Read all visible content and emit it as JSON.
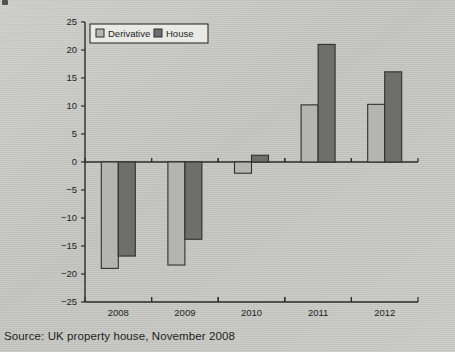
{
  "figure": {
    "source_note": "Source: UK property house, November 2008"
  },
  "legend": {
    "position": "top-left-inside",
    "entries": [
      {
        "label": "Derivative",
        "swatch": "light-gray-square",
        "color": "#b4b4b0"
      },
      {
        "label": "House",
        "swatch": "dark-gray-square",
        "color": "#6e6e6c"
      }
    ]
  },
  "colors": {
    "background": "#c8c8c5",
    "derivative": "#b4b4b0",
    "house": "#6e6e6c",
    "axis": "#2b2b2b",
    "text": "#1e1e1e",
    "legend_panel": "#e9e9e6"
  },
  "axes": {
    "y_ticks": [
      "25",
      "20",
      "15",
      "10",
      "5",
      "0",
      "-5",
      "-10",
      "-15",
      "-20",
      "-25"
    ],
    "x_ticks": [
      "2008",
      "2009",
      "2010",
      "2011",
      "2012"
    ]
  },
  "chart_data": {
    "type": "bar",
    "title": "",
    "subtitle": "",
    "xlabel": "",
    "ylabel": "",
    "categories": [
      "2008",
      "2009",
      "2010",
      "2011",
      "2012"
    ],
    "series": [
      {
        "name": "Derivative",
        "color": "#b4b4b0",
        "values": [
          -19,
          -18.4,
          -2,
          10.2,
          10.3
        ]
      },
      {
        "name": "House",
        "color": "#6e6e6c",
        "values": [
          -16.8,
          -13.8,
          1.2,
          21,
          16.1
        ]
      }
    ],
    "ylim": [
      -25,
      25
    ],
    "ytick_step": 5,
    "grid": false,
    "legend": [
      "Derivative",
      "House"
    ],
    "legend_position": "upper left",
    "annotations": [
      "Source: UK property house, November 2008"
    ]
  }
}
